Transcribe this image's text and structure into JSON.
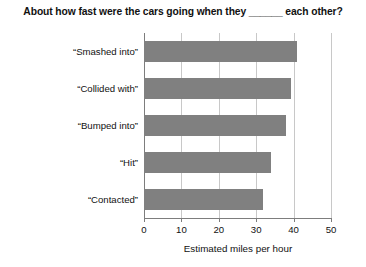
{
  "chart_data": {
    "type": "bar",
    "orientation": "horizontal",
    "title": "About how fast were the cars going when they ______ each other?",
    "xlabel": "Estimated miles per hour",
    "ylabel": "",
    "categories": [
      "“Smashed into”",
      "“Collided with”",
      "“Bumped into”",
      "“Hit”",
      "“Contacted”"
    ],
    "values": [
      40.8,
      39.3,
      38.1,
      34.0,
      31.8
    ],
    "xlim": [
      0,
      50
    ],
    "ylim": null,
    "xticks": [
      0,
      10,
      20,
      30,
      40,
      50
    ],
    "xtick_labels": [
      "0",
      "10",
      "20",
      "30",
      "40",
      "50"
    ],
    "grid": "vertical",
    "legend": null,
    "bar_color": "#808080",
    "gridline_color": "#c8c8c8",
    "axis_color": "#7d7d7d"
  },
  "title": {
    "text": "About how fast were the cars going when they ______ each other?"
  },
  "axis": {
    "x_title": "Estimated miles per hour"
  }
}
